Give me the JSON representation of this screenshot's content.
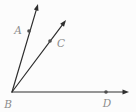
{
  "figure": {
    "background_color": "#fcfcfc",
    "line_color": "#2e2e2e",
    "dot_color": "#4d4d4d",
    "label_color": "#8c8c8c",
    "label_font_size": 10.5,
    "line_width": 1.2,
    "dot_radius": 1.8,
    "arrow_length": 6.5,
    "arrow_half_width": 2.4,
    "vertex": {
      "label": "B",
      "x": 12,
      "y": 92,
      "label_x": 8,
      "label_y": 108
    },
    "rays": [
      {
        "name": "ray-BA",
        "to_x": 38,
        "to_y": 4
      },
      {
        "name": "ray-BC",
        "to_x": 66,
        "to_y": 20
      },
      {
        "name": "ray-BD",
        "to_x": 129,
        "to_y": 92
      }
    ],
    "points": [
      {
        "label": "A",
        "x": 29,
        "y": 31,
        "label_x": 18,
        "label_y": 34
      },
      {
        "label": "C",
        "x": 50,
        "y": 41,
        "label_x": 61,
        "label_y": 47
      },
      {
        "label": "D",
        "x": 106,
        "y": 92,
        "label_x": 107,
        "label_y": 107
      }
    ]
  }
}
